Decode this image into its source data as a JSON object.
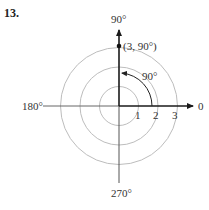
{
  "problem_number": "13.",
  "diagram": {
    "type": "polar-coordinate-plot",
    "angle_labels": {
      "top": "90°",
      "left": "180°",
      "right": "0",
      "bottom": "270°"
    },
    "radial_tick_labels": [
      "1",
      "2",
      "3"
    ],
    "circles_radii": [
      1,
      2,
      3
    ],
    "point": {
      "r": 3,
      "theta_deg": 90,
      "label": "(3, 90°)"
    },
    "angle_arc": {
      "from_deg": 0,
      "to_deg": 90,
      "label": "90°"
    },
    "colors": {
      "axis_dark": "#1a1a1a",
      "axis_light": "#555555",
      "circle": "#bbbbbb",
      "text": "#333333"
    }
  }
}
